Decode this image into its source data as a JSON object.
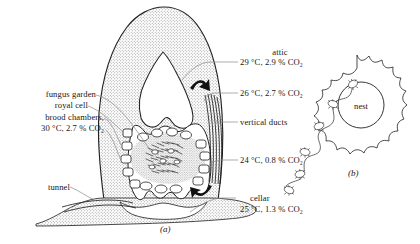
{
  "figure": {
    "panel_a_id": "(a)",
    "panel_b_id": "(b)",
    "nest_label": "nest"
  },
  "labels": {
    "left": [
      {
        "id": "fungus-garden",
        "text": "fungus garden"
      },
      {
        "id": "royal-cell",
        "text": "royal cell"
      },
      {
        "id": "brood-chambers",
        "text": "brood chambers,"
      },
      {
        "id": "brood-chambers-conditions",
        "text": "30 °C, 2.7 % CO₂"
      },
      {
        "id": "tunnel",
        "text": "tunnel"
      }
    ],
    "right": [
      {
        "id": "attic",
        "text": "attic"
      },
      {
        "id": "attic-conditions",
        "text": "29 °C, 2.9 % CO₂"
      },
      {
        "id": "upper-mound-conditions",
        "text": "26 °C, 2.7 % CO₂"
      },
      {
        "id": "vertical-ducts",
        "text": "vertical ducts"
      },
      {
        "id": "lower-mound-conditions",
        "text": "24 °C, 0.8 % CO₂"
      },
      {
        "id": "cellar",
        "text": "cellar"
      },
      {
        "id": "cellar-conditions",
        "text": "25 °C, 1.3 % CO₂"
      }
    ]
  },
  "measurements": [
    {
      "region": "attic",
      "temperature_c": 29,
      "co2_percent": 2.9
    },
    {
      "region": "upper mound",
      "temperature_c": 26,
      "co2_percent": 2.7
    },
    {
      "region": "brood chambers",
      "temperature_c": 30,
      "co2_percent": 2.7
    },
    {
      "region": "lower mound",
      "temperature_c": 24,
      "co2_percent": 0.8
    },
    {
      "region": "cellar",
      "temperature_c": 25,
      "co2_percent": 1.3
    }
  ],
  "colors": {
    "ink": "#1a1a1a",
    "mound_fill": "#d8d8d8",
    "stipple": "#8a8a8a",
    "leader": "#7d7d7d",
    "white": "#ffffff"
  }
}
